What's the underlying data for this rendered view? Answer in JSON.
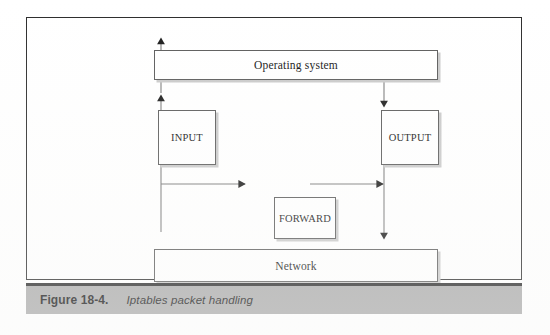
{
  "figure": {
    "caption_number": "Figure 18-4.",
    "caption_title": "Iptables packet handling"
  },
  "diagram": {
    "type": "flow-diagram",
    "nodes": [
      {
        "id": "os",
        "label": "Operating system"
      },
      {
        "id": "input",
        "label": "INPUT"
      },
      {
        "id": "output",
        "label": "OUTPUT"
      },
      {
        "id": "forward",
        "label": "FORWARD"
      },
      {
        "id": "network",
        "label": "Network"
      }
    ],
    "edges": [
      {
        "from": "network",
        "to": "input",
        "direction": "up"
      },
      {
        "from": "input",
        "to": "os",
        "direction": "up"
      },
      {
        "from": "os",
        "to": "output",
        "direction": "down"
      },
      {
        "from": "network",
        "to": "forward",
        "direction": "right"
      },
      {
        "from": "forward",
        "to": "network",
        "direction": "right-then-down"
      },
      {
        "from": "output",
        "to": "network",
        "direction": "down"
      }
    ]
  },
  "colors": {
    "frame_border": "#2b2b2b",
    "box_border": "#5a5a5a",
    "box_shadow": "#c9c9c9",
    "caption_band": "#a9a9a9",
    "caption_rule": "#232323",
    "line": "#777777",
    "arrowhead": "#1a1a1a",
    "page_background": "#ffffff"
  }
}
